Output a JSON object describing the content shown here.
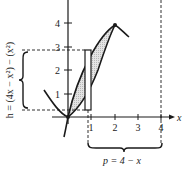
{
  "diagram": {
    "type": "area-between-curves",
    "curves": [
      {
        "name": "upper",
        "equation": "y = 4x - x^2"
      },
      {
        "name": "lower",
        "equation": "y = x^2"
      }
    ],
    "intersections": [
      [
        0,
        0
      ],
      [
        2,
        4
      ]
    ],
    "x_ticks": [
      "1",
      "2",
      "3",
      "4"
    ],
    "y_ticks": [
      "1",
      "2",
      "3",
      "4"
    ],
    "x_axis_label": "x",
    "height_label": "h = (4x − x²) − (x²)",
    "distance_label": "p = 4 − x",
    "vertical_dashed_line_x": 4,
    "rectangle": {
      "x_from": 0.85,
      "x_to": 1.05,
      "y_from": 0.4,
      "y_to": 2.9
    },
    "colors": {
      "stroke": "#1a1a1a",
      "fill": "#d9d9d9",
      "background": "#ffffff"
    }
  }
}
